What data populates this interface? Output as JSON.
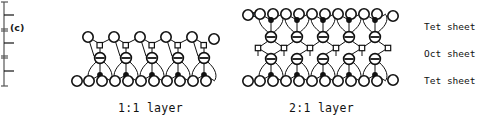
{
  "figure": {
    "type": "schematic-diagram",
    "panels": [
      {
        "id": "c",
        "label": "(c)",
        "caption": "1:1 layer",
        "sheets": [
          "Tet sheet",
          "Oct sheet"
        ],
        "rows": {
          "top_oxygen_count": 6,
          "tetrahedral_cation_count": 5,
          "hydroxyl_count": 5,
          "octahedral_cation_count": 5,
          "bottom_oxygen_count": 11
        }
      },
      {
        "id": "d",
        "label": "(d)",
        "caption": "2:1 layer",
        "sheets": [
          "Tet sheet",
          "Oct sheet",
          "Tet sheet"
        ],
        "rows": {
          "top_oxygen_count": 11,
          "upper_tet_cation_count": 5,
          "upper_hydroxyl_count": 5,
          "octahedral_cation_count": 5,
          "lower_hydroxyl_count": 5,
          "lower_tet_cation_count": 5,
          "bottom_oxygen_count": 11
        }
      }
    ],
    "bracket_labels": [
      "Tet  sheet",
      "Oct  sheet",
      "Tet  sheet"
    ],
    "legend_symbols": [
      {
        "name": "large-open-circle",
        "meaning": "oxygen"
      },
      {
        "name": "barred-circle",
        "meaning": "hydroxyl"
      },
      {
        "name": "small-open-square",
        "meaning": "tetrahedral cation"
      },
      {
        "name": "small-filled-circle",
        "meaning": "octahedral cation"
      }
    ],
    "colors": {
      "ink": "#111111",
      "background": "#ffffff"
    }
  }
}
